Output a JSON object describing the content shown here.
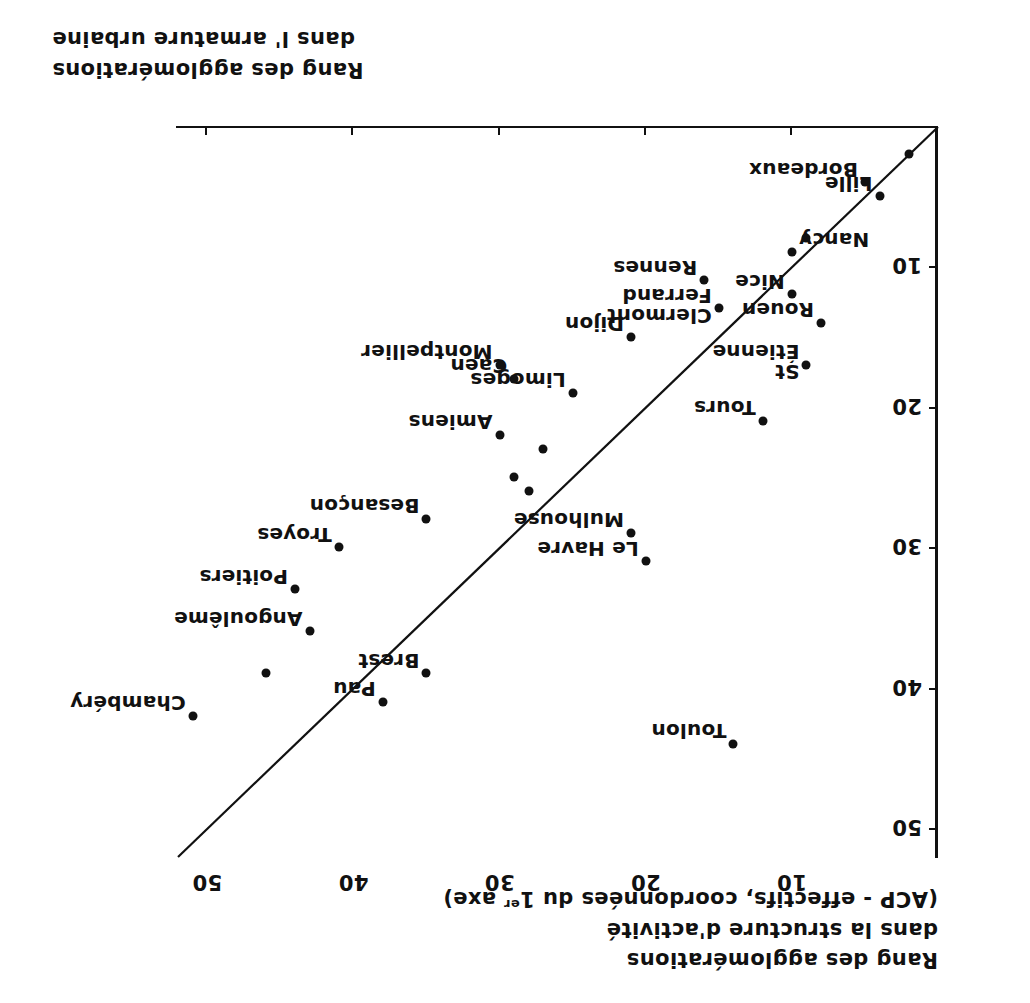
{
  "figure": {
    "width": 1030,
    "height": 1003,
    "orientation": "rotated-180",
    "ink_color": "#111111",
    "paper_color": "#ffffff"
  },
  "captions": {
    "y_axis": {
      "line1": "Rang des agglomérations",
      "line2": "dans la structure d'activité",
      "line3_pre": "(ACP - effectifs, coordonnées du 1",
      "line3_sup": "er",
      "line3_post": " axe)"
    },
    "x_axis": {
      "line1": "Rang des agglomérations",
      "line2": "dans l' armature urbaine"
    }
  },
  "chart_data": {
    "type": "scatter",
    "title": "",
    "xlabel": "Rang des agglomérations dans l' armature urbaine",
    "ylabel": "Rang des agglomérations dans la structure d'activité (ACP - effectifs, coordonnées du 1er axe)",
    "xlim": [
      0,
      52
    ],
    "ylim": [
      0,
      52
    ],
    "xticks": [
      10,
      20,
      30,
      40,
      50
    ],
    "yticks": [
      10,
      20,
      30,
      40,
      50
    ],
    "grid": false,
    "legend": null,
    "axes_note": "Both axes are rank axes increasing away from the origin; the plate is printed upside down.",
    "reference_line": {
      "name": "identity-line",
      "from": [
        0,
        0
      ],
      "to": [
        52,
        52
      ],
      "equation": "y = x"
    },
    "points": [
      {
        "label": "",
        "x": 2,
        "y": 2,
        "label_pos": "none"
      },
      {
        "label": "Bordeaux",
        "x": 5,
        "y": 4,
        "label_pos": "left"
      },
      {
        "label": "Lille",
        "x": 4,
        "y": 5,
        "label_pos": "left"
      },
      {
        "label": "",
        "x": 9,
        "y": 8,
        "label_pos": "none"
      },
      {
        "label": "Nancy",
        "x": 10,
        "y": 9,
        "label_pos": "right"
      },
      {
        "label": "Rennes",
        "x": 16,
        "y": 11,
        "label_pos": "left"
      },
      {
        "label": "Nice",
        "x": 10,
        "y": 12,
        "label_pos": "left"
      },
      {
        "label": "Clermont Ferrand",
        "x": 15,
        "y": 13,
        "label_pos": "left"
      },
      {
        "label": "Rouen",
        "x": 8,
        "y": 14,
        "label_pos": "left"
      },
      {
        "label": "Dijon",
        "x": 21,
        "y": 15,
        "label_pos": "left"
      },
      {
        "label": "St Étienne",
        "x": 9,
        "y": 17,
        "label_pos": "left"
      },
      {
        "label": "Montpellier",
        "x": 30,
        "y": 17,
        "label_pos": "left"
      },
      {
        "label": "Caen",
        "x": 29,
        "y": 18,
        "label_pos": "left"
      },
      {
        "label": "Limoges",
        "x": 25,
        "y": 19,
        "label_pos": "left"
      },
      {
        "label": "Tours",
        "x": 12,
        "y": 21,
        "label_pos": "left"
      },
      {
        "label": "Amiens",
        "x": 30,
        "y": 22,
        "label_pos": "left"
      },
      {
        "label": "",
        "x": 27,
        "y": 23,
        "label_pos": "none"
      },
      {
        "label": "",
        "x": 29,
        "y": 25,
        "label_pos": "none"
      },
      {
        "label": "",
        "x": 28,
        "y": 26,
        "label_pos": "none"
      },
      {
        "label": "Besançon",
        "x": 35,
        "y": 28,
        "label_pos": "left"
      },
      {
        "label": "Mulhouse",
        "x": 21,
        "y": 29,
        "label_pos": "left"
      },
      {
        "label": "Le Havre",
        "x": 20,
        "y": 31,
        "label_pos": "left"
      },
      {
        "label": "Troyes",
        "x": 41,
        "y": 30,
        "label_pos": "left"
      },
      {
        "label": "Poitiers",
        "x": 44,
        "y": 33,
        "label_pos": "left"
      },
      {
        "label": "Angoulême",
        "x": 43,
        "y": 36,
        "label_pos": "left"
      },
      {
        "label": "",
        "x": 46,
        "y": 39,
        "label_pos": "none"
      },
      {
        "label": "Brest",
        "x": 35,
        "y": 39,
        "label_pos": "left"
      },
      {
        "label": "Pau",
        "x": 38,
        "y": 41,
        "label_pos": "left"
      },
      {
        "label": "Chambéry",
        "x": 51,
        "y": 42,
        "label_pos": "left"
      },
      {
        "label": "Toulon",
        "x": 14,
        "y": 44,
        "label_pos": "left"
      }
    ]
  }
}
